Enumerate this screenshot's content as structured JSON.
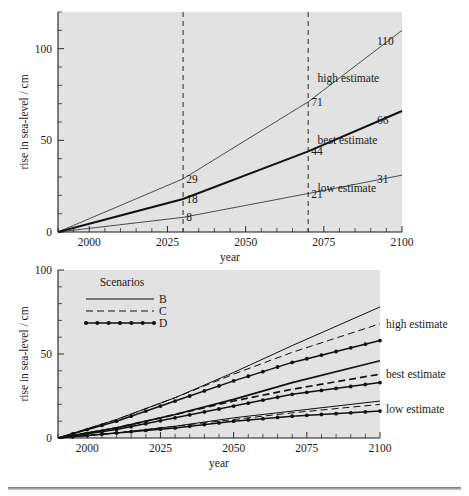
{
  "figure": {
    "title_visible": false,
    "background": "#ffffff",
    "plot_background": "#e2e2e2",
    "line_color": "#111111"
  },
  "chart_data": [
    {
      "id": "top",
      "type": "line",
      "title": "",
      "xlabel": "year",
      "ylabel": "rise in sea-level / cm",
      "xlim": [
        1990,
        2100
      ],
      "ylim": [
        0,
        120
      ],
      "xticks": [
        2000,
        2025,
        2050,
        2075,
        2100
      ],
      "xticklabels": [
        "2000",
        "2025",
        "2050",
        "2075",
        "2100"
      ],
      "xminor_step": 5,
      "yticks": [
        0,
        50,
        100
      ],
      "yticklabels": [
        "0",
        "50",
        "100"
      ],
      "yminor_step": 10,
      "grid": false,
      "legend_position": "none",
      "reference_lines": [
        {
          "x": 2030,
          "style": "dashed"
        },
        {
          "x": 2070,
          "style": "dashed"
        }
      ],
      "series": [
        {
          "name": "high estimate",
          "style": "thin",
          "label": "high estimate",
          "label_x": 2073,
          "label_y": 82,
          "x": [
            1990,
            2030,
            2070,
            2100
          ],
          "values": [
            0,
            29,
            71,
            110
          ]
        },
        {
          "name": "best estimate",
          "style": "bold",
          "label": "best estimate",
          "label_x": 2073,
          "label_y": 48,
          "x": [
            1990,
            2030,
            2070,
            2100
          ],
          "values": [
            0,
            18,
            44,
            66
          ]
        },
        {
          "name": "low estimate",
          "style": "thin",
          "label": "low estimate",
          "label_x": 2073,
          "label_y": 22,
          "x": [
            1990,
            2030,
            2070,
            2100
          ],
          "values": [
            0,
            8,
            21,
            31
          ]
        }
      ],
      "annotations": [
        {
          "text": "29",
          "x": 2031,
          "y": 29,
          "anchor": "start"
        },
        {
          "text": "18",
          "x": 2031,
          "y": 18,
          "anchor": "start"
        },
        {
          "text": "8",
          "x": 2031,
          "y": 8,
          "anchor": "start"
        },
        {
          "text": "71",
          "x": 2071,
          "y": 71,
          "anchor": "start"
        },
        {
          "text": "44",
          "x": 2071,
          "y": 44,
          "anchor": "start"
        },
        {
          "text": "21",
          "x": 2071,
          "y": 21,
          "anchor": "start"
        },
        {
          "text": "110",
          "x": 2092,
          "y": 104,
          "anchor": "start"
        },
        {
          "text": "66",
          "x": 2092,
          "y": 61,
          "anchor": "start"
        },
        {
          "text": "31",
          "x": 2092,
          "y": 29,
          "anchor": "start"
        }
      ]
    },
    {
      "id": "bottom",
      "type": "line",
      "title": "",
      "xlabel": "year",
      "ylabel": "rise in sea-level / cm",
      "xlim": [
        1990,
        2100
      ],
      "ylim": [
        0,
        100
      ],
      "xticks": [
        2000,
        2025,
        2050,
        2075,
        2100
      ],
      "xticklabels": [
        "2000",
        "2025",
        "2050",
        "2075",
        "2100"
      ],
      "xminor_step": 5,
      "yticks": [
        0,
        50,
        100
      ],
      "yticklabels": [
        "0",
        "50",
        "100"
      ],
      "yminor_step": 10,
      "grid": false,
      "legend_position": "upper-left",
      "legend_title": "Scenarios",
      "legend_entries": [
        {
          "label": "B",
          "style": "solid"
        },
        {
          "label": "C",
          "style": "dashed"
        },
        {
          "label": "D",
          "style": "dotted-marker"
        }
      ],
      "group_labels": [
        {
          "text": "high estimate",
          "x": 2103,
          "y": 68
        },
        {
          "text": "best estimate",
          "x": 2103,
          "y": 38
        },
        {
          "text": "low estimate",
          "x": 2103,
          "y": 17
        }
      ],
      "series": [
        {
          "name": "high estimate - B",
          "group": "high estimate",
          "scenario": "B",
          "style": "solid",
          "x": [
            1990,
            2010,
            2030,
            2050,
            2070,
            2100
          ],
          "values": [
            0,
            11,
            24,
            39,
            55,
            78
          ]
        },
        {
          "name": "high estimate - C",
          "group": "high estimate",
          "scenario": "C",
          "style": "dashed",
          "x": [
            1990,
            2010,
            2030,
            2050,
            2070,
            2100
          ],
          "values": [
            0,
            11,
            24,
            38,
            51,
            68
          ]
        },
        {
          "name": "high estimate - D",
          "group": "high estimate",
          "scenario": "D",
          "style": "dotted-marker",
          "x": [
            1990,
            2010,
            2030,
            2050,
            2070,
            2100
          ],
          "values": [
            0,
            10,
            22,
            34,
            45,
            58
          ]
        },
        {
          "name": "best estimate - B",
          "group": "best estimate",
          "scenario": "B",
          "style": "solid-bold",
          "x": [
            1990,
            2010,
            2030,
            2050,
            2070,
            2100
          ],
          "values": [
            0,
            6,
            14,
            23,
            33,
            46
          ]
        },
        {
          "name": "best estimate - C",
          "group": "best estimate",
          "scenario": "C",
          "style": "dashed-bold",
          "x": [
            1990,
            2010,
            2030,
            2050,
            2070,
            2100
          ],
          "values": [
            0,
            6,
            14,
            22,
            29,
            38
          ]
        },
        {
          "name": "best estimate - D",
          "group": "best estimate",
          "scenario": "D",
          "style": "dotted-marker",
          "x": [
            1990,
            2010,
            2030,
            2050,
            2070,
            2100
          ],
          "values": [
            0,
            5,
            12,
            19,
            26,
            33
          ]
        },
        {
          "name": "low estimate - B",
          "group": "low estimate",
          "scenario": "B",
          "style": "solid",
          "x": [
            1990,
            2010,
            2030,
            2050,
            2070,
            2100
          ],
          "values": [
            0,
            3,
            7,
            12,
            16,
            22
          ]
        },
        {
          "name": "low estimate - C",
          "group": "low estimate",
          "scenario": "C",
          "style": "dashed",
          "x": [
            1990,
            2010,
            2030,
            2050,
            2070,
            2100
          ],
          "values": [
            0,
            3,
            7,
            11,
            15,
            20
          ]
        },
        {
          "name": "low estimate - D",
          "group": "low estimate",
          "scenario": "D",
          "style": "dotted-marker",
          "x": [
            1990,
            2010,
            2030,
            2050,
            2070,
            2100
          ],
          "values": [
            0,
            3,
            6,
            10,
            13,
            16
          ]
        }
      ]
    }
  ]
}
